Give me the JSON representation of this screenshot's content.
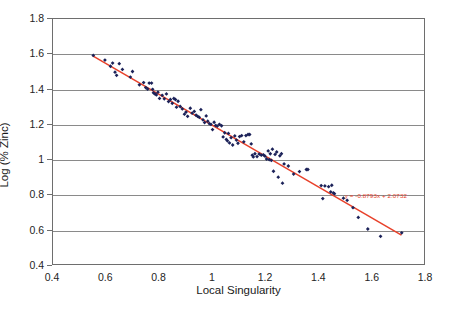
{
  "chart_data": {
    "type": "scatter",
    "title": "",
    "xlabel": "Local Singularity",
    "ylabel": "Log (% Zinc)",
    "xlim": [
      0.4,
      1.8
    ],
    "ylim": [
      0.4,
      1.8
    ],
    "xticks": [
      "0.4",
      "0.6",
      "0.8",
      "1",
      "1.2",
      "1.4",
      "1.6",
      "1.8"
    ],
    "yticks": [
      "0.4",
      "0.6",
      "0.8",
      "1",
      "1.2",
      "1.4",
      "1.6",
      "1.8"
    ],
    "xtick_values": [
      0.4,
      0.6,
      0.8,
      1.0,
      1.2,
      1.4,
      1.6,
      1.8
    ],
    "ytick_values": [
      0.4,
      0.6,
      0.8,
      1.0,
      1.2,
      1.4,
      1.6,
      1.8
    ],
    "grid": "horizontal",
    "legend": "none",
    "marker_color": "#1c2259",
    "trendline_color": "#e8412a",
    "trendline": {
      "equation": "y = -0.8793x + 2.0732",
      "slope": -0.8793,
      "intercept": 2.0732,
      "x_start": 0.55,
      "x_end": 1.715
    },
    "series": [
      {
        "name": "Zinc samples",
        "points": [
          [
            0.552,
            1.592
          ],
          [
            0.596,
            1.565
          ],
          [
            0.617,
            1.53
          ],
          [
            0.625,
            1.548
          ],
          [
            0.634,
            1.496
          ],
          [
            0.64,
            1.478
          ],
          [
            0.65,
            1.545
          ],
          [
            0.662,
            1.512
          ],
          [
            0.692,
            1.468
          ],
          [
            0.7,
            1.5
          ],
          [
            0.726,
            1.424
          ],
          [
            0.742,
            1.437
          ],
          [
            0.75,
            1.408
          ],
          [
            0.757,
            1.4
          ],
          [
            0.763,
            1.434
          ],
          [
            0.772,
            1.434
          ],
          [
            0.776,
            1.398
          ],
          [
            0.779,
            1.378
          ],
          [
            0.785,
            1.372
          ],
          [
            0.79,
            1.366
          ],
          [
            0.796,
            1.382
          ],
          [
            0.802,
            1.346
          ],
          [
            0.812,
            1.364
          ],
          [
            0.82,
            1.344
          ],
          [
            0.828,
            1.372
          ],
          [
            0.836,
            1.328
          ],
          [
            0.843,
            1.34
          ],
          [
            0.85,
            1.318
          ],
          [
            0.856,
            1.346
          ],
          [
            0.862,
            1.34
          ],
          [
            0.866,
            1.296
          ],
          [
            0.872,
            1.33
          ],
          [
            0.88,
            1.3
          ],
          [
            0.888,
            1.286
          ],
          [
            0.896,
            1.256
          ],
          [
            0.902,
            1.268
          ],
          [
            0.908,
            1.244
          ],
          [
            0.918,
            1.29
          ],
          [
            0.925,
            1.262
          ],
          [
            0.933,
            1.272
          ],
          [
            0.94,
            1.25
          ],
          [
            0.946,
            1.244
          ],
          [
            0.952,
            1.238
          ],
          [
            0.958,
            1.282
          ],
          [
            0.966,
            1.224
          ],
          [
            0.972,
            1.208
          ],
          [
            0.978,
            1.246
          ],
          [
            0.984,
            1.216
          ],
          [
            0.99,
            1.202
          ],
          [
            0.996,
            1.198
          ],
          [
            1.002,
            1.168
          ],
          [
            1.008,
            1.21
          ],
          [
            1.014,
            1.192
          ],
          [
            1.02,
            1.188
          ],
          [
            1.028,
            1.198
          ],
          [
            1.036,
            1.19
          ],
          [
            1.042,
            1.126
          ],
          [
            1.048,
            1.15
          ],
          [
            1.054,
            1.112
          ],
          [
            1.058,
            1.104
          ],
          [
            1.062,
            1.146
          ],
          [
            1.066,
            1.092
          ],
          [
            1.072,
            1.122
          ],
          [
            1.078,
            1.08
          ],
          [
            1.086,
            1.132
          ],
          [
            1.092,
            1.108
          ],
          [
            1.098,
            1.09
          ],
          [
            1.104,
            1.128
          ],
          [
            1.112,
            1.134
          ],
          [
            1.12,
            1.098
          ],
          [
            1.128,
            1.134
          ],
          [
            1.136,
            1.14
          ],
          [
            1.142,
            1.14
          ],
          [
            1.148,
            1.086
          ],
          [
            1.152,
            1.022
          ],
          [
            1.156,
            1.012
          ],
          [
            1.162,
            1.03
          ],
          [
            1.17,
            1.014
          ],
          [
            1.178,
            1.028
          ],
          [
            1.186,
            1.022
          ],
          [
            1.194,
            1.024
          ],
          [
            1.2,
            1.016
          ],
          [
            1.206,
            1.0
          ],
          [
            1.212,
            1.046
          ],
          [
            1.216,
            0.996
          ],
          [
            1.22,
            1.03
          ],
          [
            1.224,
            0.992
          ],
          [
            1.228,
            1.056
          ],
          [
            1.232,
            0.93
          ],
          [
            1.238,
            1.026
          ],
          [
            1.244,
            1.04
          ],
          [
            1.25,
            0.896
          ],
          [
            1.256,
            1.018
          ],
          [
            1.262,
            1.03
          ],
          [
            1.266,
            0.862
          ],
          [
            1.272,
            0.972
          ],
          [
            1.288,
            0.96
          ],
          [
            1.308,
            0.914
          ],
          [
            1.33,
            0.928
          ],
          [
            1.356,
            0.94
          ],
          [
            1.362,
            0.94
          ],
          [
            1.412,
            0.848
          ],
          [
            1.418,
            0.774
          ],
          [
            1.426,
            0.846
          ],
          [
            1.44,
            0.842
          ],
          [
            1.448,
            0.812
          ],
          [
            1.452,
            0.85
          ],
          [
            1.458,
            0.806
          ],
          [
            1.462,
            0.802
          ],
          [
            1.496,
            0.776
          ],
          [
            1.51,
            0.764
          ],
          [
            1.532,
            0.722
          ],
          [
            1.552,
            0.666
          ],
          [
            1.588,
            0.6
          ],
          [
            1.636,
            0.558
          ],
          [
            1.716,
            0.578
          ]
        ]
      }
    ]
  },
  "figure": {
    "caption": ""
  }
}
